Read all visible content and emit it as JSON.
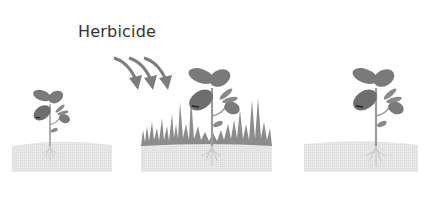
{
  "diagram": {
    "label": "Herbicide",
    "panels": [
      {
        "id": "before",
        "description": "young seedling in soil"
      },
      {
        "id": "spray",
        "description": "herbicide applied to plant with weeds"
      },
      {
        "id": "after",
        "description": "plant survives, weeds removed"
      }
    ],
    "colors": {
      "leaf": "#7a7a7a",
      "leaf_dark": "#5e5e5e",
      "stem": "#9a9a9a",
      "soil": "#e6e6e6",
      "weeds": "#8c8c8c",
      "arrow": "#7d7d7d",
      "text": "#333333"
    }
  }
}
